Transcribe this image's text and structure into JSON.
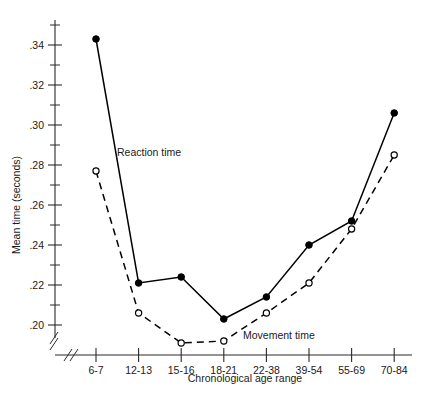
{
  "chart_data": {
    "type": "line",
    "title": "",
    "xlabel": "Chronological age range",
    "ylabel": "Mean time (seconds)",
    "categories": [
      "6-7",
      "12-13",
      "15-16",
      "18-21",
      "22-38",
      "39-54",
      "55-69",
      "70-84"
    ],
    "ylim": [
      0.19,
      0.35
    ],
    "ytick_labels": [
      ".20",
      ".22",
      ".24",
      ".26",
      ".28",
      ".30",
      ".32",
      ".34"
    ],
    "ytick_values": [
      0.2,
      0.22,
      0.24,
      0.26,
      0.28,
      0.3,
      0.32,
      0.34
    ],
    "yminor_values": [
      0.19,
      0.21,
      0.23,
      0.25,
      0.27,
      0.29,
      0.31,
      0.33,
      0.35
    ],
    "grid": false,
    "legend_position": "inline-annotation",
    "axis_break_x": true,
    "axis_break_y": true,
    "series": [
      {
        "name": "Reaction time",
        "marker": "filled-circle",
        "line": "solid",
        "values": [
          0.343,
          0.221,
          0.224,
          0.203,
          0.214,
          0.24,
          0.252,
          0.306
        ]
      },
      {
        "name": "Movement time",
        "marker": "open-circle",
        "line": "dashed",
        "values": [
          0.277,
          0.206,
          0.191,
          0.192,
          0.206,
          0.221,
          0.248,
          0.285
        ]
      }
    ],
    "annotations": [
      {
        "text": "Reaction time",
        "x_px": 117,
        "y_px": 156
      },
      {
        "text": "Movement time",
        "x_px": 243,
        "y_px": 339
      }
    ]
  },
  "colors": {
    "ink": "#000000",
    "axis": "#2a2a2a",
    "background": "#ffffff"
  }
}
